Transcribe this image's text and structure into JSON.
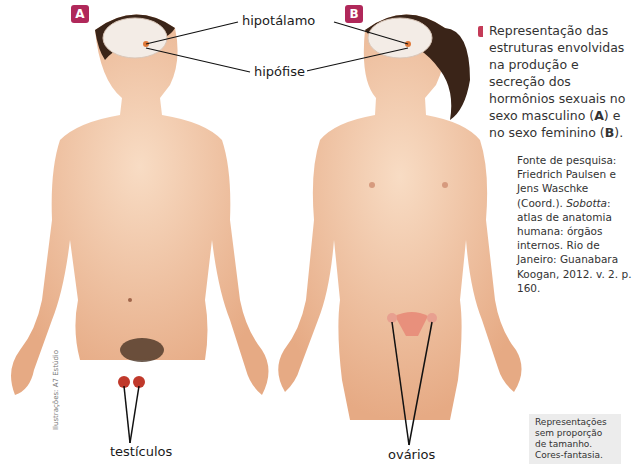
{
  "figures": {
    "male": {
      "badge": "A",
      "label_bottom": "testículos"
    },
    "female": {
      "badge": "B",
      "label_bottom": "ovários"
    }
  },
  "labels": {
    "hypothalamus": "hipotálamo",
    "pituitary": "hipófise"
  },
  "caption": {
    "text_prefix": "Representação das estruturas envolvidas na produção e secreção dos hormônios sexuais no sexo masculino (",
    "a": "A",
    "text_mid": ") e no sexo feminino (",
    "b": "B",
    "text_suffix": ")."
  },
  "source": {
    "line1": "Fonte de pesquisa: Friedrich Paulsen e Jens Waschke (Coord.).",
    "title_italic": "Sobotta",
    "line2": ": atlas de anatomia humana: órgãos internos. Rio de Janeiro: Guanabara Koogan, 2012. v. 2. p. 160."
  },
  "note": "Representações sem proporção de tamanho. Cores-fantasia.",
  "credit": "Ilustrações: A7 Estúdio",
  "colors": {
    "badge": "#b0285a",
    "skin": "#f2c6a4",
    "skin_shade": "#e3a882",
    "hair": "#3a2418",
    "gonad": "#c0392b"
  }
}
